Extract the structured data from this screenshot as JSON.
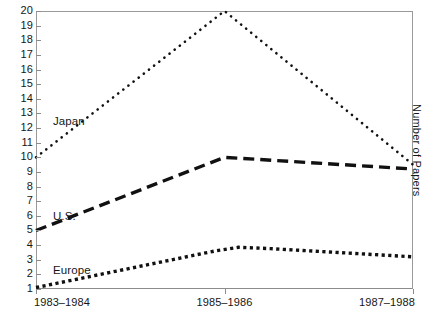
{
  "chart_data": {
    "type": "line",
    "title": "",
    "xlabel": "",
    "ylabel": "Number of Papers",
    "categories": [
      "1983–1984",
      "1985–1986",
      "1987–1988"
    ],
    "x": [
      0,
      1,
      2
    ],
    "ylim": [
      1,
      20
    ],
    "xlim": [
      0,
      2
    ],
    "grid": false,
    "legend_position": "inline-left",
    "yticks": [
      20,
      19,
      18,
      17,
      16,
      15,
      14,
      13,
      12,
      11,
      10,
      9,
      8,
      7,
      6,
      5,
      4,
      3,
      2,
      1
    ],
    "ytick_labels": [
      "20",
      "19",
      "18",
      "17",
      "16",
      "15",
      "14",
      "13",
      "12",
      "11",
      "10",
      "9",
      "8",
      "7",
      "6",
      "5",
      "4",
      "3",
      "2",
      "1"
    ],
    "series": [
      {
        "name": "Japan",
        "values": [
          10.0,
          20.0,
          9.5
        ],
        "style": "dotted-fine",
        "color": "#111111",
        "label_x_pct": 4.5,
        "label_y_value": 12.45
      },
      {
        "name": "U.S.",
        "values": [
          5.0,
          10.0,
          9.2
        ],
        "style": "dashed-long",
        "color": "#111111",
        "label_x_pct": 4.5,
        "label_y_value": 6.0
      },
      {
        "name": "Europe",
        "values": [
          1.1,
          3.85,
          3.2
        ],
        "style": "dotted-square",
        "color": "#111111",
        "label_x_pct": 4.5,
        "label_y_value": 2.3
      }
    ],
    "annotations": []
  },
  "axes": {
    "right_title": "Number of Papers",
    "x_tick_labels": [
      "1983–1984",
      "1985–1986",
      "1987–1988"
    ],
    "frame_color": "#9a9a9a",
    "axis_color": "#8c8c8c"
  }
}
